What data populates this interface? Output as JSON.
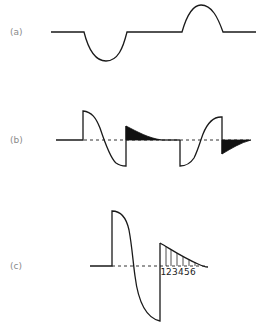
{
  "panels": [
    {
      "id": "a",
      "label": "(a)",
      "description": "Baseline with a negative half-wave dip followed by a positive half-wave bump"
    },
    {
      "id": "b",
      "label": "(b)",
      "description": "Two pulses with exponential decay tails shaded black, dashed baseline"
    },
    {
      "id": "c",
      "label": "(c)",
      "description": "Large pulse followed by decaying tail divided into numbered segments"
    }
  ],
  "segments": [
    "1",
    "2",
    "3",
    "4",
    "5",
    "6"
  ],
  "colors": {
    "line": "#1a1a1a",
    "fill": "#111111",
    "label": "#8a8a8a",
    "background": "#ffffff"
  }
}
